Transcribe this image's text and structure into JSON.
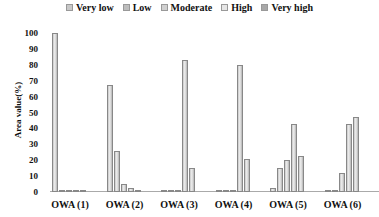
{
  "chart_data": {
    "type": "bar",
    "title": "",
    "xlabel": "",
    "ylabel": "Area value(%)",
    "ylim": [
      0,
      100
    ],
    "yticks": [
      0,
      10,
      20,
      30,
      40,
      50,
      60,
      70,
      80,
      90,
      100
    ],
    "categories": [
      "OWA (1)",
      "OWA (2)",
      "OWA (3)",
      "OWA (4)",
      "OWA (5)",
      "OWA (6)"
    ],
    "legend_position": "top",
    "grid": false,
    "series": [
      {
        "name": "Very low",
        "color": "#c8c8c8",
        "values": [
          100,
          67,
          0.5,
          0.5,
          2.5,
          0.5
        ]
      },
      {
        "name": "Low",
        "color": "#bdbdbd",
        "values": [
          0.5,
          26,
          0.5,
          0.5,
          15,
          0.5
        ]
      },
      {
        "name": "Moderate",
        "color": "#d0d0d0",
        "values": [
          0.5,
          5,
          1.5,
          0.5,
          20,
          12
        ]
      },
      {
        "name": "High",
        "color": "#e6e6e6",
        "values": [
          0.5,
          2.5,
          83,
          80,
          43,
          42.5
        ]
      },
      {
        "name": "Very high",
        "color": "#a8a8a8",
        "values": [
          0.5,
          0.5,
          15,
          21,
          22.5,
          47
        ]
      }
    ]
  },
  "legend": [
    "Very low",
    "Low",
    "Moderate",
    "High",
    "Very high"
  ]
}
